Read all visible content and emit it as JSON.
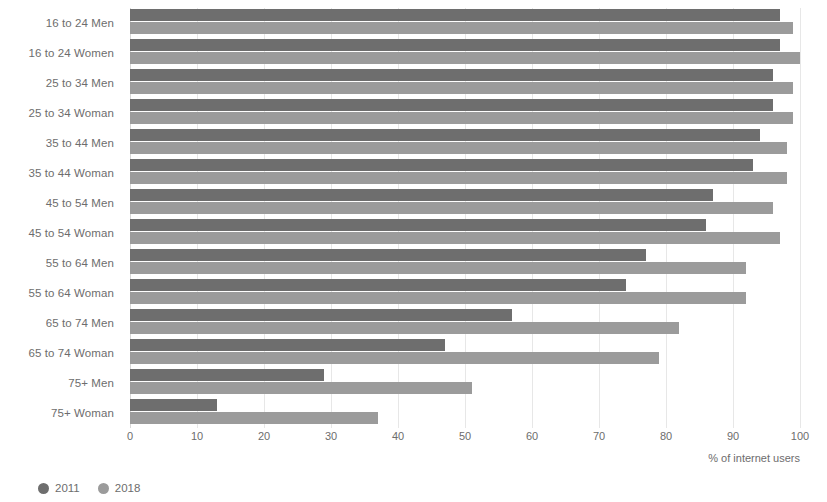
{
  "chart_data": {
    "type": "bar",
    "orientation": "horizontal",
    "title": "",
    "subtitle": "",
    "xlabel": "% of internet users",
    "ylabel": "",
    "xlim": [
      0,
      100
    ],
    "xticks": [
      0,
      10,
      20,
      30,
      40,
      50,
      60,
      70,
      80,
      90,
      100
    ],
    "grid": true,
    "legend_position": "bottom-left",
    "categories": [
      "16 to 24 Men",
      "16 to 24 Women",
      "25 to 34 Men",
      "25 to 34 Woman",
      "35 to 44 Men",
      "35 to 44 Woman",
      "45 to 54 Men",
      "45 to 54 Woman",
      "55 to 64 Men",
      "55 to 64 Woman",
      "65 to 74 Men",
      "65 to 74 Woman",
      "75+ Men",
      "75+ Woman"
    ],
    "series": [
      {
        "name": "2011",
        "color": "#6e6e6e",
        "values": [
          97,
          97,
          96,
          96,
          94,
          93,
          87,
          86,
          77,
          74,
          57,
          47,
          29,
          13
        ]
      },
      {
        "name": "2018",
        "color": "#9b9b9b",
        "values": [
          99,
          100,
          99,
          99,
          98,
          98,
          96,
          97,
          92,
          92,
          82,
          79,
          51,
          37
        ]
      }
    ]
  },
  "axis": {
    "units_label": "% of internet users"
  },
  "colors": {
    "series_2011": "#6e6e6e",
    "series_2018": "#9b9b9b",
    "gridline": "#e7e7e7",
    "text": "#6d6d6d",
    "background": "#ffffff"
  }
}
